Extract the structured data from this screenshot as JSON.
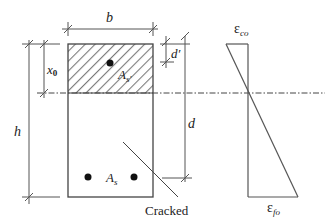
{
  "diagram": {
    "type": "beam-cross-section-strain",
    "labels": {
      "width": "b",
      "height": "h",
      "neutral_axis_depth": "x",
      "neutral_axis_depth_sub": "0",
      "effective_depth": "d",
      "cover_depth": "d′",
      "compression_steel": "A",
      "compression_steel_sub": "s′",
      "tension_steel": "A",
      "tension_steel_sub": "s",
      "crack_label": "Cracked",
      "top_strain": "ε",
      "top_strain_sub": "co",
      "bottom_strain": "ε",
      "bottom_strain_sub": "fo"
    },
    "colors": {
      "line": "#555555",
      "hatch": "#777777",
      "steel": "#111111",
      "background": "#ffffff"
    }
  }
}
